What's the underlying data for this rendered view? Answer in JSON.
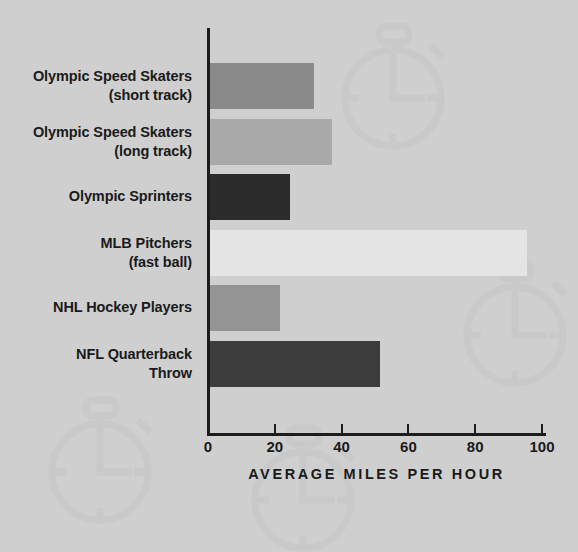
{
  "chart_data": {
    "type": "bar",
    "orientation": "horizontal",
    "title": "",
    "xlabel": "AVERAGE MILES PER HOUR",
    "ylabel": "",
    "xlim": [
      0,
      100
    ],
    "xticks": [
      0,
      20,
      40,
      60,
      80,
      100
    ],
    "xtick_labels": [
      "0",
      "20",
      "40",
      "60",
      "80",
      "100"
    ],
    "grid": false,
    "legend": "none",
    "background_color": "#cfcfcf",
    "axis_color": "#1c1c1c",
    "text_color": "#1a1a1a",
    "categories": [
      "Olympic Speed Skaters\n(short track)",
      "Olympic Speed Skaters\n(long track)",
      "Olympic Sprinters",
      "MLB Pitchers\n(fast ball)",
      "NHL Hockey Players",
      "NFL Quarterback\nThrow"
    ],
    "values": [
      31,
      36.5,
      24,
      95,
      21,
      51
    ],
    "bars": [
      {
        "label_line1": "Olympic Speed Skaters",
        "label_line2": "(short track)",
        "value": 31,
        "color": "#8a8a8a"
      },
      {
        "label_line1": "Olympic Speed Skaters",
        "label_line2": "(long track)",
        "value": 36.5,
        "color": "#a9a9a9"
      },
      {
        "label_line1": "Olympic Sprinters",
        "label_line2": "",
        "value": 24,
        "color": "#2b2b2b"
      },
      {
        "label_line1": "MLB Pitchers",
        "label_line2": "(fast ball)",
        "value": 95,
        "color": "#e4e4e4"
      },
      {
        "label_line1": "NHL Hockey Players",
        "label_line2": "",
        "value": 21,
        "color": "#949494"
      },
      {
        "label_line1": "NFL Quarterback",
        "label_line2": "Throw",
        "value": 51,
        "color": "#3d3d3d"
      }
    ],
    "watermark": "stopwatch-icon"
  }
}
